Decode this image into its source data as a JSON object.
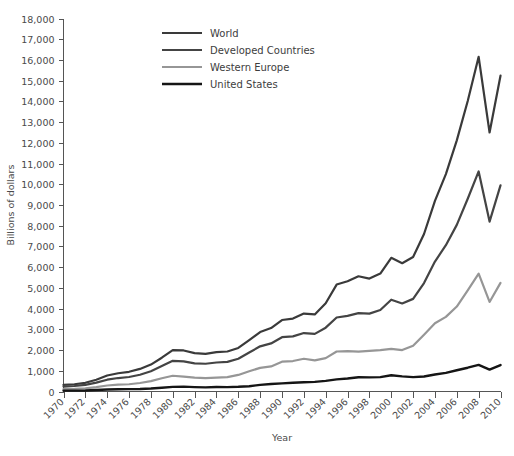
{
  "chart_data": {
    "type": "line",
    "title": "",
    "xlabel": "Year",
    "ylabel": "Billions of dollars",
    "xlim": [
      1970,
      2010
    ],
    "ylim": [
      0,
      18000
    ],
    "grid": false,
    "legend_position": "top-center",
    "x_tick_labels": [
      "1970",
      "1972",
      "1974",
      "1976",
      "1978",
      "1980",
      "1982",
      "1984",
      "1986",
      "1988",
      "1990",
      "1992",
      "1994",
      "1996",
      "1998",
      "2000",
      "2002",
      "2004",
      "2006",
      "2008",
      "2010"
    ],
    "y_tick_labels": [
      "0",
      "1,000",
      "2,000",
      "3,000",
      "4,000",
      "5,000",
      "6,000",
      "7,000",
      "8,000",
      "9,000",
      "10,000",
      "11,000",
      "12,000",
      "13,000",
      "14,000",
      "15,000",
      "16,000",
      "17,000",
      "18,000"
    ],
    "y_ticks": [
      0,
      1000,
      2000,
      3000,
      4000,
      5000,
      6000,
      7000,
      8000,
      9000,
      10000,
      11000,
      12000,
      13000,
      14000,
      15000,
      16000,
      17000,
      18000
    ],
    "x": [
      1970,
      1971,
      1972,
      1973,
      1974,
      1975,
      1976,
      1977,
      1978,
      1979,
      1980,
      1981,
      1982,
      1983,
      1984,
      1985,
      1986,
      1987,
      1988,
      1989,
      1990,
      1991,
      1992,
      1993,
      1994,
      1995,
      1996,
      1997,
      1998,
      1999,
      2000,
      2001,
      2002,
      2003,
      2004,
      2005,
      2006,
      2007,
      2008,
      2009,
      2010
    ],
    "series": [
      {
        "name": "World",
        "color": "#3a3a3a",
        "width": 2.2,
        "values": [
          320,
          350,
          420,
          570,
          770,
          880,
          950,
          1090,
          1300,
          1630,
          2000,
          1980,
          1850,
          1820,
          1900,
          1930,
          2100,
          2480,
          2870,
          3060,
          3450,
          3520,
          3760,
          3720,
          4260,
          5160,
          5320,
          5560,
          5450,
          5690,
          6450,
          6190,
          6490,
          7600,
          9200,
          10490,
          12120,
          14020,
          16150,
          12500,
          15240
        ]
      },
      {
        "name": "Developed Countries",
        "color": "#444444",
        "width": 2.2,
        "values": [
          240,
          265,
          320,
          430,
          570,
          650,
          700,
          810,
          980,
          1230,
          1480,
          1450,
          1360,
          1340,
          1400,
          1430,
          1580,
          1880,
          2180,
          2320,
          2620,
          2660,
          2820,
          2780,
          3080,
          3570,
          3650,
          3780,
          3760,
          3930,
          4430,
          4250,
          4470,
          5230,
          6270,
          7060,
          8040,
          9300,
          10620,
          8200,
          9950
        ]
      },
      {
        "name": "Western Europe",
        "color": "#969696",
        "width": 2.2,
        "values": [
          110,
          125,
          155,
          215,
          290,
          330,
          350,
          410,
          500,
          640,
          760,
          720,
          670,
          650,
          670,
          690,
          800,
          980,
          1140,
          1210,
          1440,
          1470,
          1580,
          1500,
          1610,
          1930,
          1950,
          1920,
          1960,
          2000,
          2060,
          2000,
          2210,
          2740,
          3290,
          3600,
          4100,
          4880,
          5690,
          4320,
          5240
        ]
      },
      {
        "name": "United States",
        "color": "#151515",
        "width": 2.4,
        "values": [
          43,
          44,
          49,
          71,
          98,
          108,
          115,
          121,
          144,
          182,
          221,
          234,
          212,
          201,
          218,
          213,
          227,
          254,
          322,
          364,
          394,
          422,
          448,
          465,
          513,
          585,
          625,
          688,
          683,
          696,
          782,
          731,
          694,
          724,
          819,
          901,
          1026,
          1148,
          1287,
          1056,
          1278
        ]
      }
    ],
    "annotations": []
  },
  "legend": {
    "entries": [
      {
        "label": "World",
        "color": "#3a3a3a"
      },
      {
        "label": "Developed Countries",
        "color": "#444444"
      },
      {
        "label": "Western Europe",
        "color": "#969696"
      },
      {
        "label": "United States",
        "color": "#151515"
      }
    ]
  }
}
